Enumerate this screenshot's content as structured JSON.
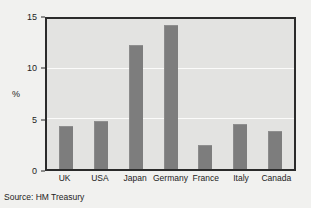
{
  "figure": {
    "source_note": "Source: HM Treasury",
    "background_color": "#f1f1ef",
    "plot_background_color": "#e3e3e1",
    "bar_color": "#7d7d7d",
    "frame_color": "#2b2b2b",
    "gridline_color": "#fbfbfa"
  },
  "chart_data": {
    "type": "bar",
    "title": "",
    "xlabel": "",
    "ylabel": "%",
    "categories": [
      "UK",
      "USA",
      "Japan",
      "Germany",
      "France",
      "Italy",
      "Canada"
    ],
    "values": [
      4.2,
      4.7,
      12.3,
      14.3,
      2.3,
      4.4,
      3.7
    ],
    "ylim": [
      0,
      15
    ],
    "yticks": [
      0,
      5,
      10,
      15
    ],
    "ytick_labels": [
      "0",
      "5",
      "10",
      "15"
    ],
    "grid": true,
    "legend": "none"
  }
}
